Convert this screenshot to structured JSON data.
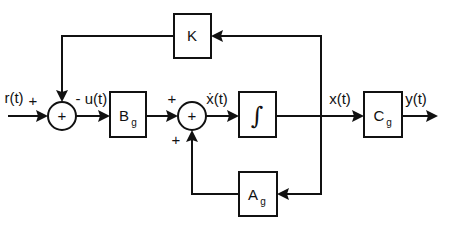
{
  "diagram": {
    "type": "state-space block diagram",
    "signals": {
      "input": "r(t)",
      "control": "u(t)",
      "state_derivative": "ẋ(t)",
      "state": "x(t)",
      "output": "y(t)"
    },
    "blocks": {
      "feedback_gain": {
        "label": "K",
        "sub": ""
      },
      "input_matrix": {
        "label": "B",
        "sub": "g"
      },
      "integrator": {
        "label": "∫",
        "sub": ""
      },
      "output_matrix": {
        "label": "C",
        "sub": "g"
      },
      "state_matrix": {
        "label": "A",
        "sub": "g"
      }
    },
    "summing_junctions": {
      "sum1": {
        "symbol": "+",
        "sign_left": "+",
        "sign_top": "-"
      },
      "sum2": {
        "symbol": "+",
        "sign_left": "+",
        "sign_bottom": "+"
      }
    },
    "colors": {
      "stroke": "#111111",
      "background": "#ffffff"
    }
  }
}
